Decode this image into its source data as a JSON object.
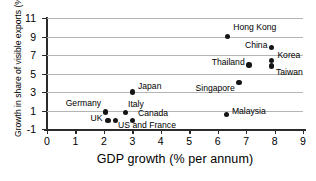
{
  "chart_data": {
    "type": "scatter",
    "title": "",
    "xlabel": "GDP growth (% per annum)",
    "ylabel": "Growth in share of visible exports (% p.a.)",
    "xlim": [
      0,
      9
    ],
    "ylim": [
      -1,
      11
    ],
    "xticks": [
      "0",
      "1",
      "2",
      "3",
      "4",
      "5",
      "6",
      "7",
      "8",
      "9"
    ],
    "yticks": [
      "11",
      "9",
      "7",
      "5",
      "3",
      "1",
      "-1"
    ],
    "grid": "horizontal",
    "legend": "none",
    "marker_color": "#151515",
    "grid_color": "#b4b4b4",
    "axis_color": "#2b2b2b",
    "points": [
      {
        "name": "Hong Kong",
        "x": 6.35,
        "y": 9.0,
        "label": "Hong Kong",
        "lx": 6.55,
        "ly": 9.9,
        "anchor": "start"
      },
      {
        "name": "China",
        "x": 7.9,
        "y": 7.8,
        "label": "China",
        "lx": 7.75,
        "ly": 8.0,
        "anchor": "end"
      },
      {
        "name": "Korea",
        "x": 7.9,
        "y": 6.4,
        "label": "Korea",
        "lx": 8.1,
        "ly": 6.9,
        "anchor": "start"
      },
      {
        "name": "Taiwan",
        "x": 7.9,
        "y": 5.8,
        "label": "Taiwan",
        "lx": 8.05,
        "ly": 5.1,
        "anchor": "start"
      },
      {
        "name": "Thailand",
        "x": 7.1,
        "y": 5.9,
        "label": "Thailand",
        "lx": 6.95,
        "ly": 6.1,
        "anchor": "end"
      },
      {
        "name": "Singapore",
        "x": 6.75,
        "y": 4.0,
        "label": "Singapore",
        "lx": 6.6,
        "ly": 3.3,
        "anchor": "end"
      },
      {
        "name": "Japan",
        "x": 3.0,
        "y": 3.0,
        "label": "Japan",
        "lx": 3.2,
        "ly": 3.5,
        "anchor": "start"
      },
      {
        "name": "Malaysia",
        "x": 6.3,
        "y": 0.6,
        "label": "Malaysia",
        "lx": 6.5,
        "ly": 0.8,
        "anchor": "start"
      },
      {
        "name": "Germany",
        "x": 2.05,
        "y": 0.85,
        "label": "Germany",
        "lx": 1.9,
        "ly": 1.7,
        "anchor": "end"
      },
      {
        "name": "Italy",
        "x": 2.75,
        "y": 0.8,
        "label": "Italy",
        "lx": 2.85,
        "ly": 1.6,
        "anchor": "start"
      },
      {
        "name": "Canada",
        "x": 3.0,
        "y": -0.1,
        "label": "Canada",
        "lx": 3.2,
        "ly": 0.6,
        "anchor": "start"
      },
      {
        "name": "UK",
        "x": 2.15,
        "y": -0.1,
        "label": "UK",
        "lx": 1.95,
        "ly": 0.1,
        "anchor": "end"
      },
      {
        "name": "US and France",
        "x": 2.4,
        "y": -0.1,
        "label": "US and France",
        "lx": 2.5,
        "ly": -0.7,
        "anchor": "start"
      }
    ]
  }
}
